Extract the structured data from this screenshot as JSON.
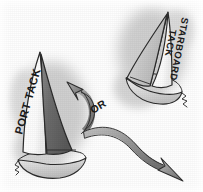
{
  "illustration": {
    "title": "Port Tack and Starboard Tack",
    "style": "pencil-sketch grayscale line drawing",
    "background_color": "#fefefe"
  },
  "labels": {
    "port_tack": "PORT TACK",
    "starboard_tack_line1": "STARBOARD",
    "starboard_tack_line2": "TACK",
    "or": "OR"
  },
  "boats": [
    {
      "name": "port-tack-boat",
      "label": "PORT TACK",
      "position": "lower-left",
      "mainsail_color": "#ffffff",
      "jib_color": "#6e6e6e",
      "hull_color": "#d8d8d8",
      "outline_color": "#2b2b2b"
    },
    {
      "name": "starboard-tack-boat",
      "label": "STARBOARD TACK",
      "position": "upper-right",
      "mainsail_color": "#ffffff",
      "jib_color": "#cfcfcf",
      "hull_color": "#d4d4d4",
      "outline_color": "#2b2b2b"
    }
  ],
  "arrows": [
    {
      "name": "arrow-up-left",
      "direction": "up-left",
      "meaning": "tack option one",
      "fill": "#8f8f8f",
      "outline": "#2d2d2d"
    },
    {
      "name": "arrow-down-right",
      "direction": "down-right",
      "meaning": "tack option two",
      "fill": "#9a9a9a",
      "outline": "#2d2d2d"
    }
  ],
  "colors": {
    "ink": "#2b2b2b",
    "shadow_cloud": "#b9b9b9",
    "dark_sail": "#6e6e6e",
    "light_sail": "#cfcfcf",
    "arrow_gray": "#939393"
  }
}
